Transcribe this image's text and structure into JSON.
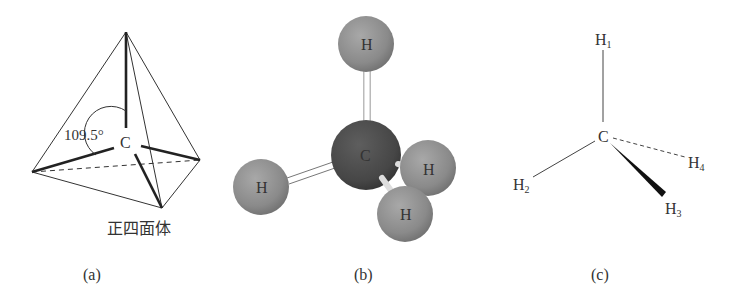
{
  "figure": {
    "panel_a": {
      "caption": "(a)",
      "shape_label": "正四面体",
      "angle_label": "109.5°",
      "center_atom": "C"
    },
    "panel_b": {
      "caption": "(b)",
      "center_atom": "C",
      "hydrogens": [
        "H",
        "H",
        "H",
        "H"
      ],
      "colors": {
        "carbon": "#4a4a4a",
        "hydrogen": "#8c8c8c"
      }
    },
    "panel_c": {
      "caption": "(c)",
      "center_atom": "C",
      "hydrogens": [
        {
          "symbol": "H",
          "index": "1"
        },
        {
          "symbol": "H",
          "index": "2"
        },
        {
          "symbol": "H",
          "index": "3"
        },
        {
          "symbol": "H",
          "index": "4"
        }
      ]
    }
  }
}
